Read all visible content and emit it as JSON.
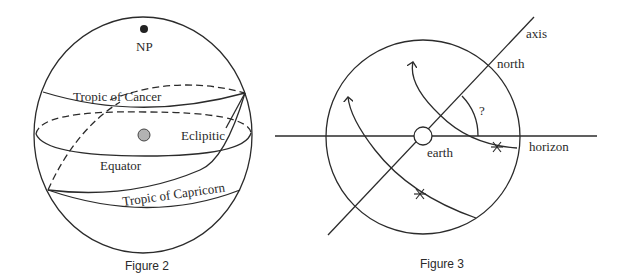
{
  "figure2": {
    "caption": "Figure 2",
    "labels": {
      "north_pole": "NP",
      "tropic_of_cancer": "Tropic of Cancer",
      "ecliptic": "Eclipitic",
      "equator": "Equator",
      "tropic_of_capricorn": "Tropic of Capricorn"
    },
    "colors": {
      "north_pole_dot": "#222222",
      "center_dot": "#b3b3b3"
    }
  },
  "figure3": {
    "caption": "Figure 3",
    "labels": {
      "axis": "axis",
      "north": "north",
      "angle": "?",
      "earth": "earth",
      "horizon": "horizon"
    },
    "markers": [
      "star-path-upper",
      "star-path-lower"
    ]
  }
}
